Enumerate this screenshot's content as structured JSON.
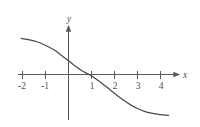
{
  "figure": {
    "background_color": "#ffffff",
    "width": 200,
    "height": 127
  },
  "axes": {
    "x_axis_label": "x",
    "y_axis_label": "y",
    "axis_color": "#5a5a5a",
    "curve_color": "#4a4a4a",
    "x_tick_labels": [
      "-2",
      "-1",
      "1",
      "2",
      "3",
      "4"
    ],
    "y_tick_labels": []
  },
  "chart_data": {
    "type": "line",
    "title": "",
    "subtitle": "",
    "xlabel": "x",
    "ylabel": "y",
    "xlim": [
      -2.55,
      4.8
    ],
    "ylim": [
      -2.1,
      1.85
    ],
    "grid": false,
    "legend": null,
    "x_ticks": [
      -2,
      -1,
      1,
      2,
      3,
      4
    ],
    "x_tick_labels": [
      "-2",
      "-1",
      "1",
      "2",
      "3",
      "4"
    ],
    "y_ticks": [],
    "y_tick_labels": [],
    "annotations": [],
    "series": [
      {
        "name": "curve",
        "description": "Monotonically decreasing sigmoid-shaped curve crossing the x-axis near x = 0.9",
        "x": [
          -2.05,
          -1.8,
          -1.5,
          -1.2,
          -0.9,
          -0.6,
          -0.3,
          0.0,
          0.3,
          0.6,
          0.9,
          1.2,
          1.5,
          1.8,
          2.1,
          2.4,
          2.7,
          3.0,
          3.3,
          3.6,
          3.9,
          4.15,
          4.35
        ],
        "y": [
          1.57,
          1.53,
          1.46,
          1.36,
          1.22,
          1.05,
          0.83,
          0.6,
          0.36,
          0.15,
          0.0,
          -0.2,
          -0.42,
          -0.66,
          -0.9,
          -1.12,
          -1.32,
          -1.48,
          -1.6,
          -1.68,
          -1.73,
          -1.76,
          -1.78
        ]
      }
    ]
  }
}
